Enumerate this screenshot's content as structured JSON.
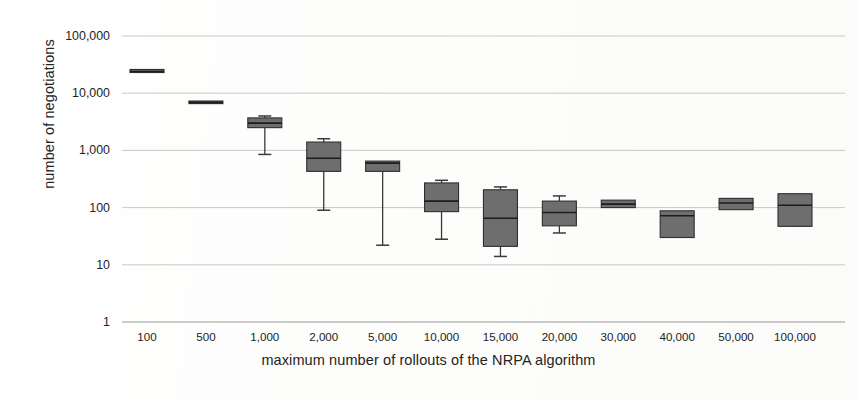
{
  "chart_data": {
    "type": "box",
    "title": "",
    "xlabel": "maximum number of rollouts of the NRPA algorithm",
    "ylabel": "number of negotiations",
    "yscale": "log",
    "ylim": [
      1,
      100000
    ],
    "ytick_labels": [
      "100,000",
      "10,000",
      "1,000",
      "100",
      "10",
      "1"
    ],
    "ytick_values": [
      100000,
      10000,
      1000,
      100,
      10,
      1
    ],
    "grid": "horizontal",
    "legend": "none",
    "categories": [
      "100",
      "500",
      "1,000",
      "2,000",
      "5,000",
      "10,000",
      "15,000",
      "20,000",
      "30,000",
      "40,000",
      "50,000",
      "100,000"
    ],
    "boxes": [
      {
        "category": "100",
        "whisker_low": 23000,
        "q1": 23000,
        "median": 24000,
        "q3": 26000,
        "whisker_high": 26000
      },
      {
        "category": "500",
        "whisker_low": 6600,
        "q1": 6600,
        "median": 6900,
        "q3": 7300,
        "whisker_high": 7300
      },
      {
        "category": "1,000",
        "whisker_low": 850,
        "q1": 2500,
        "median": 3000,
        "q3": 3700,
        "whisker_high": 4000
      },
      {
        "category": "2,000",
        "whisker_low": 90,
        "q1": 430,
        "median": 730,
        "q3": 1400,
        "whisker_high": 1600
      },
      {
        "category": "5,000",
        "whisker_low": 22,
        "q1": 430,
        "median": 600,
        "q3": 650,
        "whisker_high": 650
      },
      {
        "category": "10,000",
        "whisker_low": 28,
        "q1": 85,
        "median": 130,
        "q3": 270,
        "whisker_high": 300
      },
      {
        "category": "15,000",
        "whisker_low": 14,
        "q1": 21,
        "median": 65,
        "q3": 205,
        "whisker_high": 230
      },
      {
        "category": "20,000",
        "whisker_low": 36,
        "q1": 48,
        "median": 82,
        "q3": 130,
        "whisker_high": 160
      },
      {
        "category": "30,000",
        "whisker_low": 100,
        "q1": 100,
        "median": 115,
        "q3": 135,
        "whisker_high": 135
      },
      {
        "category": "40,000",
        "whisker_low": 30,
        "q1": 30,
        "median": 72,
        "q3": 88,
        "whisker_high": 88
      },
      {
        "category": "50,000",
        "whisker_low": 92,
        "q1": 92,
        "median": 120,
        "q3": 145,
        "whisker_high": 145
      },
      {
        "category": "100,000",
        "whisker_low": 47,
        "q1": 47,
        "median": 110,
        "q3": 175,
        "whisker_high": 175
      }
    ],
    "colors": {
      "box_fill": "#6e6e6e",
      "box_stroke": "#2f2f2f",
      "median": "#1c1c1c",
      "whisker": "#3a3a3a",
      "grid": "#c8c8c8",
      "text": "#232323",
      "background": "#ffffff"
    }
  }
}
